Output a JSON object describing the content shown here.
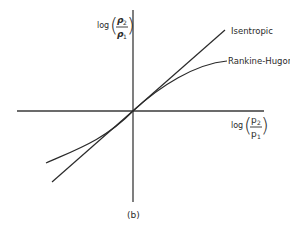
{
  "figure": {
    "caption": "(b)",
    "y_axis": {
      "label_prefix": "log",
      "numerator": "p",
      "numerator_sub": "2",
      "denominator": "p",
      "denominator_sub": "1",
      "variable": "rho",
      "description": "log(ρ2/ρ1)"
    },
    "x_axis": {
      "label_prefix": "log",
      "numerator": "p",
      "numerator_sub": "2",
      "denominator": "p",
      "denominator_sub": "1",
      "variable": "pressure",
      "description": "log(p2/p1)"
    },
    "curves": [
      {
        "name": "Isentropic",
        "shape": "straight line through origin"
      },
      {
        "name": "Rankine-Hugoniot",
        "shape": "curve tangent to isentropic at origin, bending below at high pressure"
      }
    ],
    "colors": {
      "line": "#2a2a2a",
      "background": "#ffffff"
    }
  }
}
